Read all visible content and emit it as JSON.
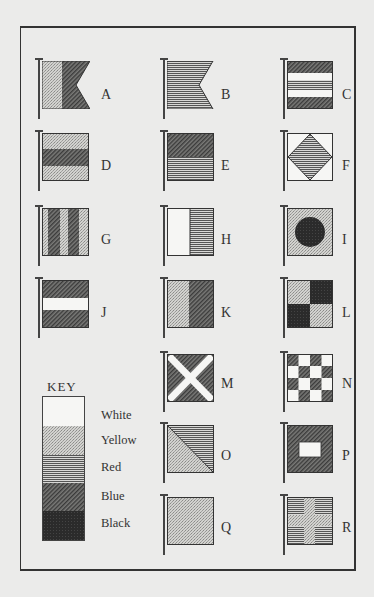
{
  "colors": {
    "white": "#f6f6f4",
    "yellow": "#c9c9c6",
    "red": "#a8a8a6",
    "blue": "#6a6a68",
    "black": "#2e2e2e",
    "ink": "#333333",
    "paper": "#ebebea"
  },
  "key": {
    "title": "KEY",
    "items": [
      {
        "label": "White",
        "color": "white"
      },
      {
        "label": "Yellow",
        "color": "yellow"
      },
      {
        "label": "Red",
        "color": "red"
      },
      {
        "label": "Blue",
        "color": "blue"
      },
      {
        "label": "Black",
        "color": "black"
      }
    ]
  },
  "flags": [
    {
      "letter": "A",
      "design": "swallowtail, hoist white/yellow, fly blue"
    },
    {
      "letter": "B",
      "design": "swallowtail, solid red"
    },
    {
      "letter": "C",
      "design": "horizontal: blue, white, red, white, blue"
    },
    {
      "letter": "D",
      "design": "horizontal: yellow, blue, yellow"
    },
    {
      "letter": "E",
      "design": "horizontal: blue over red"
    },
    {
      "letter": "F",
      "design": "white with red diamond"
    },
    {
      "letter": "G",
      "design": "vertical stripes: yellow, blue, yellow, blue, yellow"
    },
    {
      "letter": "H",
      "design": "vertical: white, red"
    },
    {
      "letter": "I",
      "design": "yellow with black disc"
    },
    {
      "letter": "J",
      "design": "horizontal: blue, white, blue"
    },
    {
      "letter": "K",
      "design": "vertical: yellow, blue"
    },
    {
      "letter": "L",
      "design": "quartered: yellow, black / black, yellow"
    },
    {
      "letter": "M",
      "design": "blue with white saltire"
    },
    {
      "letter": "N",
      "design": "4x4 checkerboard blue and white"
    },
    {
      "letter": "O",
      "design": "diagonal: red upper-right, yellow lower-left"
    },
    {
      "letter": "P",
      "design": "blue with white centre square"
    },
    {
      "letter": "Q",
      "design": "solid yellow"
    },
    {
      "letter": "R",
      "design": "red with yellow cross"
    }
  ]
}
